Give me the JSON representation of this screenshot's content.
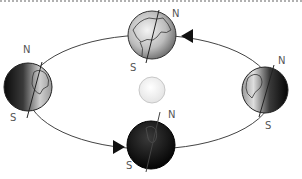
{
  "diagram": {
    "type": "earth-orbit-seasons",
    "sun": {
      "color": "#f2f2f2",
      "stroke": "#c8c8c8"
    },
    "orbit": {
      "stroke": "#444444"
    },
    "globes": [
      {
        "position": "top",
        "shading": "lit",
        "north_label": "N",
        "south_label": "S"
      },
      {
        "position": "left",
        "shading": "right-lit",
        "north_label": "N",
        "south_label": "S"
      },
      {
        "position": "bottom",
        "shading": "dark",
        "north_label": "N",
        "south_label": "S"
      },
      {
        "position": "right",
        "shading": "left-lit",
        "north_label": "N",
        "south_label": "S"
      }
    ],
    "arrows": [
      {
        "position": "top-right",
        "direction": "left"
      },
      {
        "position": "bottom-left",
        "direction": "right"
      }
    ]
  }
}
